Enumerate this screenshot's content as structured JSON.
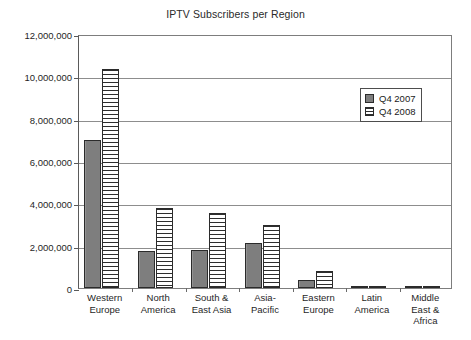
{
  "chart_data": {
    "type": "bar",
    "title": "IPTV Subscribers per Region",
    "xlabel": "",
    "ylabel": "",
    "ylim": [
      0,
      12000000
    ],
    "ytick_labels": [
      "0",
      "2,000,000",
      "4,000,000",
      "6,000,000",
      "8,000,000",
      "10,000,000",
      "12,000,000"
    ],
    "ytick_values": [
      0,
      2000000,
      4000000,
      6000000,
      8000000,
      10000000,
      12000000
    ],
    "grid": true,
    "legend_position": "upper right",
    "categories": [
      "Western Europe",
      "North America",
      "South & East Asia",
      "Asia-Pacific",
      "Eastern Europe",
      "Latin America",
      "Middle East & Africa"
    ],
    "category_lines": [
      [
        "Western",
        "Europe"
      ],
      [
        "North",
        "America"
      ],
      [
        "South &",
        "East Asia"
      ],
      [
        "Asia-",
        "Pacific"
      ],
      [
        "Eastern",
        "Europe"
      ],
      [
        "Latin",
        "America"
      ],
      [
        "Middle",
        "East &",
        "Africa"
      ]
    ],
    "series": [
      {
        "name": "Q4 2007",
        "color": "#7e7e7e",
        "pattern": "solid",
        "values": [
          7000000,
          1750000,
          1800000,
          2150000,
          400000,
          50000,
          40000
        ]
      },
      {
        "name": "Q4 2008",
        "color": "#ffffff",
        "pattern": "horizontal-stripes",
        "values": [
          10350000,
          3800000,
          3550000,
          3000000,
          800000,
          70000,
          60000
        ]
      }
    ]
  },
  "caption": {
    "fragment": ""
  }
}
